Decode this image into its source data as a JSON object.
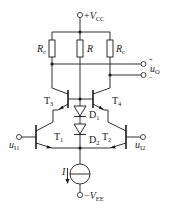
{
  "diagram": {
    "type": "circuit-schematic",
    "supply_positive": {
      "label_prefix": "+",
      "symbol": "V",
      "subscript": "CC"
    },
    "supply_negative": {
      "label_prefix": "−",
      "symbol": "V",
      "subscript": "EE"
    },
    "resistors": [
      {
        "id": "Rc_left",
        "symbol": "R",
        "subscript": "c"
      },
      {
        "id": "R_center",
        "symbol": "R",
        "subscript": ""
      },
      {
        "id": "Rc_right",
        "symbol": "R",
        "subscript": "c"
      }
    ],
    "transistors": [
      {
        "id": "T3",
        "symbol": "T",
        "subscript": "3"
      },
      {
        "id": "T4",
        "symbol": "T",
        "subscript": "4"
      },
      {
        "id": "T1",
        "symbol": "T",
        "subscript": "1"
      },
      {
        "id": "T2",
        "symbol": "T",
        "subscript": "2"
      }
    ],
    "diodes": [
      {
        "id": "D1",
        "symbol": "D",
        "subscript": "1"
      },
      {
        "id": "D2",
        "symbol": "D",
        "subscript": "2"
      }
    ],
    "current_source": {
      "symbol": "I"
    },
    "inputs": [
      {
        "id": "uI1",
        "symbol": "u",
        "subscript": "I1"
      },
      {
        "id": "uI2",
        "symbol": "u",
        "subscript": "I2"
      }
    ],
    "output": {
      "symbol": "u",
      "subscript": "O",
      "plus": "+",
      "minus": "−"
    }
  }
}
